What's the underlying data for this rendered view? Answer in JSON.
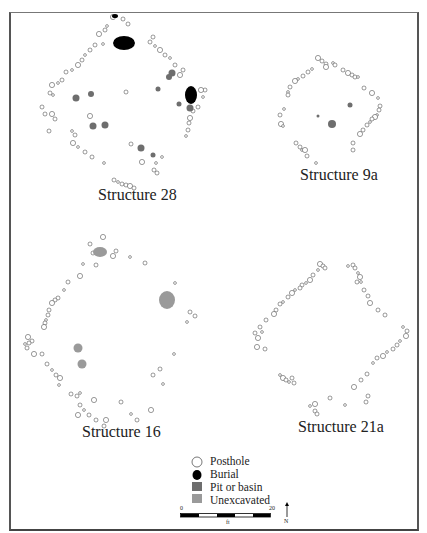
{
  "figure": {
    "structures": [
      {
        "id": "s28",
        "label": "Structure 28",
        "label_pos": [
          98,
          200
        ],
        "postholes": [
          [
            113,
            17
          ],
          [
            123,
            19
          ],
          [
            128,
            24
          ],
          [
            107,
            26
          ],
          [
            105,
            30
          ],
          [
            99,
            34
          ],
          [
            103,
            44
          ],
          [
            153,
            37
          ],
          [
            150,
            42
          ],
          [
            155,
            46
          ],
          [
            160,
            50
          ],
          [
            165,
            55
          ],
          [
            170,
            58
          ],
          [
            175,
            65
          ],
          [
            183,
            70
          ],
          [
            180,
            75
          ],
          [
            95,
            45
          ],
          [
            90,
            50
          ],
          [
            85,
            55
          ],
          [
            82,
            60
          ],
          [
            78,
            65
          ],
          [
            72,
            70
          ],
          [
            66,
            72
          ],
          [
            62,
            80
          ],
          [
            58,
            83
          ],
          [
            52,
            85
          ],
          [
            50,
            93
          ],
          [
            53,
            95
          ],
          [
            42,
            107
          ],
          [
            45,
            114
          ],
          [
            52,
            114
          ],
          [
            55,
            119
          ],
          [
            49,
            131
          ],
          [
            72,
            131
          ],
          [
            75,
            135
          ],
          [
            73,
            143
          ],
          [
            78,
            147
          ],
          [
            85,
            152
          ],
          [
            92,
            157
          ],
          [
            104,
            163
          ],
          [
            90,
            116
          ],
          [
            131,
            144
          ],
          [
            186,
            136
          ],
          [
            188,
            130
          ],
          [
            189,
            123
          ],
          [
            190,
            118
          ],
          [
            193,
            111
          ],
          [
            198,
            107
          ],
          [
            203,
            97
          ],
          [
            205,
            90
          ],
          [
            201,
            90
          ],
          [
            156,
            163
          ],
          [
            154,
            170
          ],
          [
            157,
            173
          ],
          [
            162,
            157
          ],
          [
            142,
            162
          ],
          [
            114,
            180
          ],
          [
            118,
            182
          ],
          [
            122,
            184
          ],
          [
            126,
            185
          ],
          [
            130,
            186
          ],
          [
            134,
            188
          ],
          [
            126,
            92
          ]
        ],
        "burials": [
          [
            124,
            43,
            11,
            7
          ],
          [
            115,
            16,
            3,
            2
          ],
          [
            191,
            95,
            6,
            9
          ]
        ],
        "pits": [
          [
            76,
            98,
            3.5
          ],
          [
            91,
            94,
            3
          ],
          [
            93,
            126,
            3.5
          ],
          [
            105,
            125,
            3.5
          ],
          [
            141,
            148,
            3.5
          ],
          [
            153,
            155,
            2.5
          ],
          [
            172,
            73,
            3.5
          ],
          [
            169,
            77,
            3
          ],
          [
            158,
            89,
            2.5
          ],
          [
            190,
            108,
            3.5
          ],
          [
            179,
            104,
            2.5
          ]
        ]
      },
      {
        "id": "s9a",
        "label": "Structure 9a",
        "label_pos": [
          300,
          180
        ],
        "postholes": [
          [
            318,
            58
          ],
          [
            322,
            61
          ],
          [
            326,
            64
          ],
          [
            333,
            63
          ],
          [
            335,
            65
          ],
          [
            326,
            67
          ],
          [
            312,
            69
          ],
          [
            308,
            72
          ],
          [
            303,
            76
          ],
          [
            298,
            79
          ],
          [
            295,
            81
          ],
          [
            290,
            87
          ],
          [
            288,
            92
          ],
          [
            288,
            95
          ],
          [
            343,
            70
          ],
          [
            348,
            73
          ],
          [
            352,
            75
          ],
          [
            355,
            77
          ],
          [
            358,
            77
          ],
          [
            364,
            88
          ],
          [
            372,
            93
          ],
          [
            378,
            98
          ],
          [
            380,
            106
          ],
          [
            379,
            110
          ],
          [
            377,
            115
          ],
          [
            375,
            117
          ],
          [
            372,
            119
          ],
          [
            370,
            122
          ],
          [
            367,
            125
          ],
          [
            363,
            130
          ],
          [
            360,
            134
          ],
          [
            353,
            143
          ],
          [
            353,
            150
          ],
          [
            284,
            109
          ],
          [
            280,
            115
          ],
          [
            281,
            124
          ],
          [
            283,
            126
          ],
          [
            296,
            143
          ],
          [
            300,
            147
          ],
          [
            302,
            150
          ],
          [
            305,
            150
          ],
          [
            307,
            156
          ],
          [
            316,
            163
          ]
        ],
        "burials": [],
        "pits": [
          [
            350,
            105,
            2.5
          ],
          [
            332,
            124,
            4
          ],
          [
            318,
            116,
            1.5
          ]
        ]
      },
      {
        "id": "s16",
        "label": "Structure 16",
        "label_pos": [
          82,
          437
        ],
        "postholes": [
          [
            103,
            237
          ],
          [
            90,
            244
          ],
          [
            93,
            253
          ],
          [
            96,
            253
          ],
          [
            116,
            251
          ],
          [
            113,
            256
          ],
          [
            130,
            257
          ],
          [
            145,
            263
          ],
          [
            96,
            265
          ],
          [
            83,
            264
          ],
          [
            80,
            276
          ],
          [
            68,
            282
          ],
          [
            64,
            290
          ],
          [
            58,
            298
          ],
          [
            55,
            300
          ],
          [
            52,
            303
          ],
          [
            49,
            310
          ],
          [
            48,
            315
          ],
          [
            46,
            320
          ],
          [
            45,
            323
          ],
          [
            44,
            327
          ],
          [
            175,
            283
          ],
          [
            190,
            312
          ],
          [
            195,
            316
          ],
          [
            187,
            322
          ],
          [
            28,
            337
          ],
          [
            32,
            341
          ],
          [
            25,
            344
          ],
          [
            29,
            343
          ],
          [
            27,
            348
          ],
          [
            34,
            354
          ],
          [
            42,
            354
          ],
          [
            47,
            364
          ],
          [
            52,
            370
          ],
          [
            56,
            375
          ],
          [
            60,
            378
          ],
          [
            59,
            385
          ],
          [
            71,
            394
          ],
          [
            77,
            396
          ],
          [
            80,
            393
          ],
          [
            94,
            400
          ],
          [
            80,
            405
          ],
          [
            84,
            410
          ],
          [
            89,
            415
          ],
          [
            96,
            420
          ],
          [
            106,
            420
          ],
          [
            104,
            426
          ],
          [
            121,
            402
          ],
          [
            131,
            414
          ],
          [
            137,
            420
          ],
          [
            151,
            410
          ],
          [
            174,
            354
          ],
          [
            160,
            369
          ],
          [
            153,
            375
          ],
          [
            163,
            384
          ],
          [
            78,
            415
          ]
        ],
        "burials": [],
        "pits": [],
        "unexcavated": [
          [
            100,
            252,
            7,
            5
          ],
          [
            167,
            300,
            8,
            9
          ],
          [
            78,
            348,
            4.5,
            4.5
          ],
          [
            82,
            364,
            4.5,
            4.5
          ]
        ]
      },
      {
        "id": "s21a",
        "label": "Structure 21a",
        "label_pos": [
          298,
          432
        ],
        "postholes": [
          [
            320,
            264
          ],
          [
            323,
            266
          ],
          [
            325,
            268
          ],
          [
            318,
            270
          ],
          [
            313,
            275
          ],
          [
            310,
            280
          ],
          [
            306,
            283
          ],
          [
            302,
            285
          ],
          [
            300,
            288
          ],
          [
            295,
            290
          ],
          [
            292,
            293
          ],
          [
            288,
            297
          ],
          [
            283,
            302
          ],
          [
            280,
            304
          ],
          [
            276,
            310
          ],
          [
            274,
            314
          ],
          [
            266,
            320
          ],
          [
            260,
            327
          ],
          [
            262,
            332
          ],
          [
            255,
            333
          ],
          [
            258,
            338
          ],
          [
            348,
            266
          ],
          [
            353,
            265
          ],
          [
            355,
            268
          ],
          [
            358,
            273
          ],
          [
            360,
            277
          ],
          [
            357,
            282
          ],
          [
            361,
            282
          ],
          [
            364,
            290
          ],
          [
            368,
            296
          ],
          [
            370,
            303
          ],
          [
            378,
            310
          ],
          [
            385,
            315
          ],
          [
            403,
            327
          ],
          [
            407,
            331
          ],
          [
            406,
            336
          ],
          [
            400,
            341
          ],
          [
            397,
            345
          ],
          [
            393,
            349
          ],
          [
            387,
            352
          ],
          [
            383,
            356
          ],
          [
            377,
            358
          ],
          [
            373,
            363
          ],
          [
            367,
            374
          ],
          [
            361,
            380
          ],
          [
            354,
            387
          ],
          [
            368,
            396
          ],
          [
            366,
            402
          ],
          [
            345,
            405
          ],
          [
            330,
            398
          ],
          [
            315,
            404
          ],
          [
            310,
            406
          ],
          [
            315,
            411
          ],
          [
            317,
            414
          ],
          [
            280,
            375
          ],
          [
            283,
            378
          ],
          [
            286,
            380
          ],
          [
            289,
            382
          ],
          [
            292,
            378
          ],
          [
            294,
            383
          ],
          [
            257,
            347
          ],
          [
            265,
            349
          ]
        ],
        "burials": [],
        "pits": []
      }
    ],
    "legend": {
      "items": [
        {
          "label": "Posthole",
          "symbol": "posthole"
        },
        {
          "label": "Burial",
          "symbol": "burial"
        },
        {
          "label": "Pit or basin",
          "symbol": "pit"
        },
        {
          "label": "Unexcavated",
          "symbol": "unexcavated"
        }
      ]
    },
    "scale_bar": {
      "min_label": "0",
      "max_label": "20",
      "unit": "ft"
    },
    "north_arrow": {
      "label": "N"
    },
    "colors": {
      "posthole_stroke": "#555555",
      "burial": "#000000",
      "pit": "#6e6e6e",
      "unexcavated": "#9a9a9a",
      "frame": "#555555"
    }
  }
}
